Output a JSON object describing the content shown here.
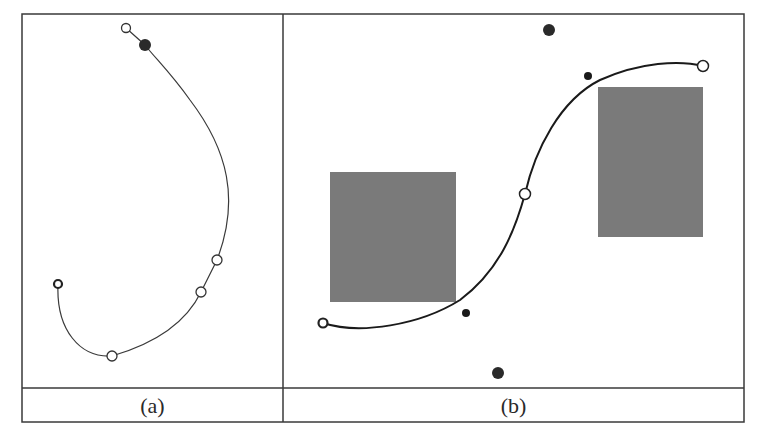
{
  "figure": {
    "panels": [
      {
        "id": "a",
        "caption": "(a)",
        "curve_color": "#3a3a3a",
        "open_points": [
          [
            126,
            28
          ],
          [
            217,
            260
          ],
          [
            201,
            292
          ],
          [
            112,
            356
          ]
        ],
        "start_point": [
          58,
          284
        ],
        "filled_points": [
          [
            145,
            45
          ]
        ]
      },
      {
        "id": "b",
        "caption": "(b)",
        "curve_color": "#1a1a1a",
        "obstacles": [
          {
            "x": 330,
            "y": 172,
            "w": 126,
            "h": 130
          },
          {
            "x": 598,
            "y": 87,
            "w": 105,
            "h": 150
          }
        ],
        "obstacle_color": "#7a7a7a",
        "open_points": [
          [
            525,
            194
          ],
          [
            703,
            66
          ]
        ],
        "start_point": [
          323,
          323
        ],
        "large_dots": [
          [
            549,
            30
          ],
          [
            498,
            373
          ]
        ],
        "small_dots": [
          [
            466,
            313
          ],
          [
            588,
            76
          ]
        ]
      }
    ]
  }
}
